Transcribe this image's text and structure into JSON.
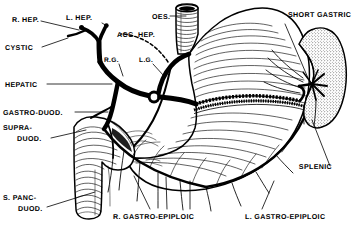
{
  "figure": {
    "style": "black-and-white engraved line drawing, stippled and hatched",
    "background_color": "#ffffff",
    "ink_color": "#000000",
    "width": 359,
    "height": 227
  },
  "labels": {
    "r_hep": "R. HEP.",
    "l_hep": "L. HEP.",
    "oes": "OES.",
    "short_gastric": "SHORT GASTRIC",
    "cystic": "CYSTIC",
    "acc_hep": "ACC. HEP.",
    "hepatic": "HEPATIC",
    "rg": "R.G.",
    "lg": "L.G.",
    "gastro_duod": "GASTRO-DUOD.",
    "supra_duod_1": "SUPRA-",
    "supra_duod_2": "DUOD.",
    "splenic": "SPLENIC",
    "s_panc_duod_1": "S. PANC-",
    "s_panc_duod_2": "DUOD.",
    "r_gastro_epiploic": "R. GASTRO-EPIPLOIC",
    "l_gastro_epiploic": "L. GASTRO-EPIPLOIC"
  },
  "structures": {
    "stomach": "stomach body and fundus, transversely hatched",
    "oesophagus": "oesophagus, vertical tube with dark lumen",
    "duodenum": "duodenal C-loop, transversely hatched",
    "spleen": "spleen, stippled bean shape with hilar vessels",
    "pylorus": "pyloric antrum",
    "celiac_ring": "celiac axis ring at junction of hepatic, left gastric and splenic arteries"
  }
}
